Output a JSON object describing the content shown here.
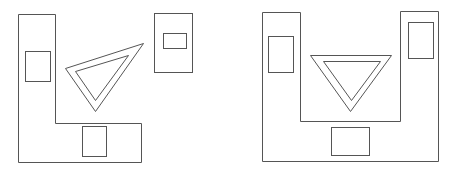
{
  "diagram": {
    "stroke_color": "#555555",
    "background": "#ffffff",
    "figures": [
      {
        "name": "left-figure",
        "shapes": [
          {
            "name": "l-shape",
            "type": "polygon",
            "points": "18,14 55,14 55,123 141,123 141,162 18,162"
          },
          {
            "name": "vertical-bar-window",
            "type": "rect",
            "x": 25,
            "y": 51,
            "w": 25,
            "h": 30
          },
          {
            "name": "bottom-bar-window",
            "type": "rect",
            "x": 82,
            "y": 126,
            "w": 24,
            "h": 30
          },
          {
            "name": "triangle-outer",
            "type": "polygon",
            "points": "65,68 143,43 95,111"
          },
          {
            "name": "triangle-inner",
            "type": "polygon",
            "points": "75,71 128,55 95,100"
          },
          {
            "name": "detached-rect",
            "type": "rect",
            "x": 154,
            "y": 13,
            "w": 38,
            "h": 59
          },
          {
            "name": "detached-rect-window",
            "type": "rect",
            "x": 163,
            "y": 33,
            "w": 23,
            "h": 15
          }
        ]
      },
      {
        "name": "right-figure",
        "shapes": [
          {
            "name": "u-shape",
            "type": "polygon",
            "points": "262,12 300,12 300,121 400,121 400,11 438,11 438,161 262,161"
          },
          {
            "name": "left-bar-window",
            "type": "rect",
            "x": 268,
            "y": 36,
            "w": 25,
            "h": 36
          },
          {
            "name": "right-bar-window",
            "type": "rect",
            "x": 408,
            "y": 22,
            "w": 25,
            "h": 36
          },
          {
            "name": "triangle-outer",
            "type": "polygon",
            "points": "310,55 391,55 350,111"
          },
          {
            "name": "triangle-inner",
            "type": "polygon",
            "points": "323,61 380,61 351,100"
          },
          {
            "name": "bottom-window",
            "type": "rect",
            "x": 331,
            "y": 127,
            "w": 38,
            "h": 28
          }
        ]
      }
    ]
  }
}
